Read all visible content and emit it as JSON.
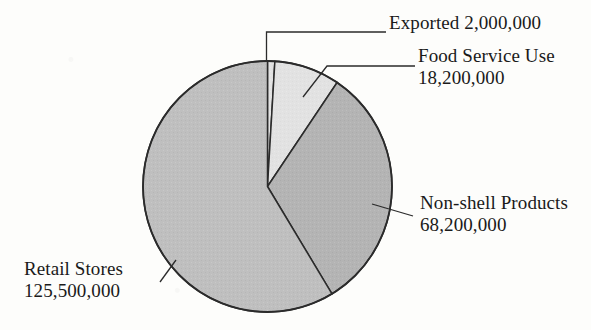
{
  "chart_data": {
    "type": "pie",
    "title": "",
    "subtitle": "",
    "xlabel": "",
    "ylabel": "",
    "legend_position": "none",
    "grid": false,
    "total": 213900000,
    "categories": [
      "Exported",
      "Food Service Use",
      "Non-shell Products",
      "Retail Stores"
    ],
    "values": [
      2000000,
      18200000,
      68200000,
      125500000
    ],
    "value_labels": [
      "2,000,000",
      "18,200,000",
      "68,200,000",
      "125,500,000"
    ],
    "percentages": [
      0.94,
      8.51,
      31.88,
      58.67
    ],
    "slice_colors": [
      "#e4e4e4",
      "#e2e2e2",
      "#b4b4b4",
      "#bfbfbf"
    ],
    "slices": [
      {
        "name": "Exported",
        "label": "Exported",
        "value": 2000000,
        "value_label": "2,000,000",
        "percent": 0.94,
        "start_angle": 0.0,
        "end_angle": 3.4,
        "color": "#e4e4e4"
      },
      {
        "name": "Food Service Use",
        "label": "Food Service Use",
        "value": 18200000,
        "value_label": "18,200,000",
        "percent": 8.51,
        "start_angle": 3.4,
        "end_angle": 34.0,
        "color": "#e2e2e2"
      },
      {
        "name": "Non-shell Products",
        "label": "Non-shell Products",
        "value": 68200000,
        "value_label": "68,200,000",
        "percent": 31.88,
        "start_angle": 34.0,
        "end_angle": 148.8,
        "color": "#b4b4b4"
      },
      {
        "name": "Retail Stores",
        "label": "Retail Stores",
        "value": 125500000,
        "value_label": "125,500,000",
        "percent": 58.67,
        "start_angle": 148.8,
        "end_angle": 360.0,
        "color": "#bfbfbf"
      }
    ]
  },
  "labels": {
    "exported": {
      "line1": "Exported  2,000,000"
    },
    "food_service": {
      "line1": "Food Service Use",
      "line2": "18,200,000"
    },
    "non_shell": {
      "line1": "Non-shell Products",
      "line2": "68,200,000"
    },
    "retail": {
      "line1": "Retail Stores",
      "line2": "125,500,000"
    }
  },
  "style": {
    "outline_color": "#2b2b2b",
    "background": "#fdfdfb",
    "text_color": "#1a1a1a"
  }
}
